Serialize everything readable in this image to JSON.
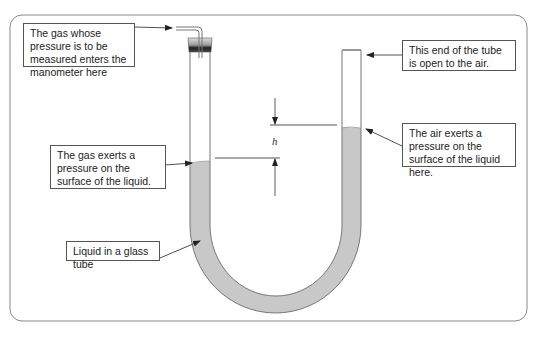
{
  "diagram": {
    "subject": "Manometer",
    "labels": {
      "gas_inlet": "The gas whose pressure is to be measured enters the manometer here",
      "open_end": "This end of the tube is open to the air.",
      "gas_pressure": "The gas exerts a pressure on the surface of the liquid.",
      "air_pressure": "The air exerts a pressure on the surface of the liquid here.",
      "liquid": "Liquid in a glass tube",
      "height": "h"
    },
    "colors": {
      "liquid": "#c8c8c8",
      "tube_outline": "#777777",
      "frame": "#888888",
      "stopper_top": "#d0d0d0",
      "stopper_bottom": "#333333",
      "label_border": "#555555"
    }
  }
}
